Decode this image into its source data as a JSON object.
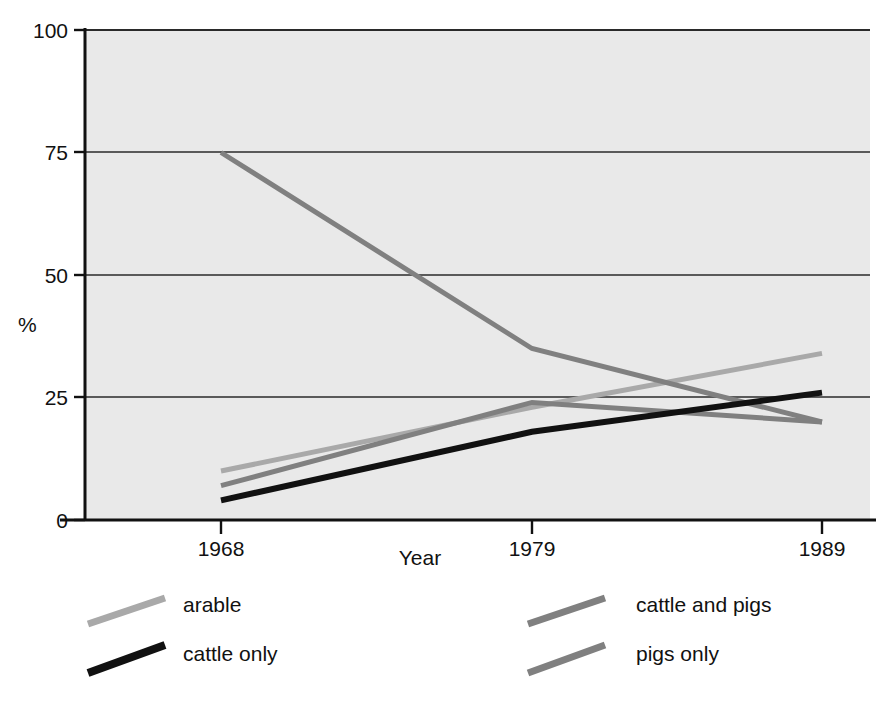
{
  "chart_data": {
    "type": "line",
    "title": "",
    "subtitle": "",
    "xlabel": "Year",
    "ylabel": "%",
    "x": [
      1968,
      1979,
      1989
    ],
    "xtick_labels": [
      "1968",
      "1979",
      "1989"
    ],
    "ytick_labels": [
      "0",
      "25",
      "50",
      "75",
      "100"
    ],
    "yticks": [
      0,
      25,
      50,
      75,
      100
    ],
    "ylim": [
      0,
      100
    ],
    "xlim": [
      1965.2,
      1992.0
    ],
    "grid": "horizontal",
    "legend_position": "below-plot",
    "plot_background": "#e9e9e9",
    "series": [
      {
        "name": "arable",
        "values": [
          10,
          23,
          34
        ],
        "color": "#a9a9a9",
        "width": 5
      },
      {
        "name": "cattle and pigs",
        "values": [
          7,
          24,
          20
        ],
        "color": "#808080",
        "width": 5
      },
      {
        "name": "pigs only",
        "values": [
          75,
          35,
          20
        ],
        "color": "#808080",
        "width": 5
      },
      {
        "name": "cattle only",
        "values": [
          4,
          18,
          26
        ],
        "color": "#111111",
        "width": 6
      }
    ]
  },
  "legend": {
    "entries": [
      {
        "label": "arable",
        "color": "#a9a9a9"
      },
      {
        "label": "cattle and pigs",
        "color": "#808080"
      },
      {
        "label": "cattle only",
        "color": "#111111"
      },
      {
        "label": "pigs only",
        "color": "#808080"
      }
    ]
  },
  "axes": {
    "y_title": "%",
    "x_title": "Year",
    "axis_color": "#111111",
    "grid_color": "#2a2a2a"
  }
}
